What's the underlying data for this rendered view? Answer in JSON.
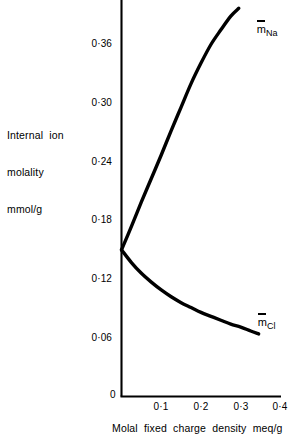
{
  "figure": {
    "width": 292,
    "height": 440,
    "background": "#ffffff",
    "ink": "#000000"
  },
  "axis_label_y": {
    "line1": "Internal  ion",
    "line2": "molality",
    "line3": "mmol/g"
  },
  "axis_label_x": "Molal  fixed  charge  density  meq/g",
  "y_ticks": [
    {
      "label": "0·36",
      "value": 0.36
    },
    {
      "label": "0·30",
      "value": 0.3
    },
    {
      "label": "0·24",
      "value": 0.24
    },
    {
      "label": "0·18",
      "value": 0.18
    },
    {
      "label": "0·12",
      "value": 0.12
    },
    {
      "label": "0·06",
      "value": 0.06
    }
  ],
  "origin_label": "0",
  "x_ticks": [
    {
      "label": "0·1",
      "value": 0.1
    },
    {
      "label": "0·2",
      "value": 0.2
    },
    {
      "label": "0·3",
      "value": 0.3
    },
    {
      "label": "0·4",
      "value": 0.4
    }
  ],
  "series_labels": {
    "na": {
      "symbol": "m",
      "subscript": "Na"
    },
    "cl": {
      "symbol": "m",
      "subscript": "Cl"
    }
  },
  "chart_data": {
    "type": "line",
    "title": "",
    "subtitle": "",
    "xlabel": "Molal fixed charge density meq/g",
    "ylabel": "Internal ion molality mmol/g",
    "xlim": [
      0,
      0.4
    ],
    "ylim": [
      0,
      0.4
    ],
    "xticks": [
      0,
      0.1,
      0.2,
      0.3,
      0.4
    ],
    "xticklabels": [
      "0",
      "0·1",
      "0·2",
      "0·3",
      "0·4"
    ],
    "yticks": [
      0,
      0.06,
      0.12,
      0.18,
      0.24,
      0.3,
      0.36
    ],
    "yticklabels": [
      "0",
      "0·06",
      "0·12",
      "0·18",
      "0·24",
      "0·30",
      "0·36"
    ],
    "grid": false,
    "legend": "inline-annotations",
    "line_color": "#000000",
    "line_width": 3.4,
    "series": [
      {
        "name": "m̄Na",
        "annotation": "m̄_Na",
        "x": [
          0.0,
          0.025,
          0.05,
          0.075,
          0.1,
          0.125,
          0.15,
          0.175,
          0.2,
          0.225,
          0.25,
          0.275,
          0.295
        ],
        "y": [
          0.15,
          0.174,
          0.199,
          0.223,
          0.247,
          0.272,
          0.296,
          0.32,
          0.341,
          0.36,
          0.375,
          0.389,
          0.397
        ]
      },
      {
        "name": "m̄Cl",
        "annotation": "m̄_Cl",
        "x": [
          0.0,
          0.025,
          0.05,
          0.075,
          0.1,
          0.125,
          0.15,
          0.175,
          0.2,
          0.225,
          0.25,
          0.275,
          0.3,
          0.325,
          0.345
        ],
        "y": [
          0.15,
          0.137,
          0.126,
          0.117,
          0.109,
          0.102,
          0.096,
          0.091,
          0.086,
          0.082,
          0.078,
          0.074,
          0.071,
          0.067,
          0.064
        ]
      }
    ],
    "branch_point": {
      "x": 0.0,
      "y": 0.15
    }
  }
}
